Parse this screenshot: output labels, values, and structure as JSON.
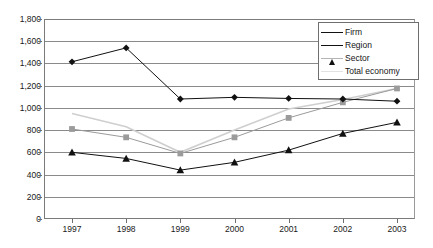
{
  "chart_data": {
    "type": "line",
    "title": "",
    "subtitle": "",
    "xlabel": "",
    "ylabel": "",
    "x": [
      "1997",
      "1998",
      "1999",
      "2000",
      "2001",
      "2002",
      "2003"
    ],
    "categories": [
      "1997",
      "1998",
      "1999",
      "2000",
      "2001",
      "2002",
      "2003"
    ],
    "ylim": [
      0,
      1800
    ],
    "ytick_step": 200,
    "ytick_labels": [
      "0",
      "200",
      "400",
      "600",
      "800",
      "1,000",
      "1,200",
      "1,400",
      "1,600",
      "1,800"
    ],
    "ytick_values": [
      0,
      200,
      400,
      600,
      800,
      1000,
      1200,
      1400,
      1600,
      1800
    ],
    "grid": "horizontal",
    "legend_position": "top-right",
    "series": [
      {
        "name": "Firm",
        "marker": "diamond",
        "color": "#111111",
        "values": [
          1415,
          1540,
          1080,
          1095,
          1085,
          1080,
          1060
        ]
      },
      {
        "name": "Region",
        "marker": "triangle",
        "color": "#111111",
        "values": [
          600,
          545,
          440,
          510,
          620,
          770,
          870
        ]
      },
      {
        "name": "Sector",
        "marker": "square",
        "color": "#9b9b9b",
        "values": [
          810,
          735,
          590,
          735,
          910,
          1050,
          1175
        ]
      },
      {
        "name": "Total economy",
        "marker": "none",
        "color": "#cfcfcf",
        "values": [
          950,
          830,
          600,
          800,
          990,
          1075,
          1175
        ]
      }
    ]
  },
  "legend": {
    "items": [
      {
        "label": "Firm"
      },
      {
        "label": "Region"
      },
      {
        "label": "Sector"
      },
      {
        "label": "Total economy"
      }
    ]
  },
  "colors": {
    "axis": "#7b7b7b",
    "grid": "#8a8a8a",
    "dark_series": "#111111",
    "sector_series": "#9b9b9b",
    "total_economy_series": "#cfcfcf",
    "background": "#ffffff"
  }
}
